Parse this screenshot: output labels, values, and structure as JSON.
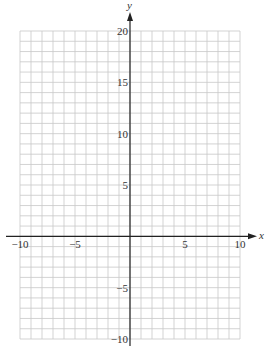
{
  "chart_data": {
    "type": "scatter",
    "title": "",
    "xlabel": "x",
    "ylabel": "y",
    "xlim": [
      -10,
      10
    ],
    "ylim": [
      -10,
      20
    ],
    "grid": true,
    "grid_step": 1,
    "x_ticks": [
      -10,
      -5,
      5,
      10
    ],
    "y_ticks": [
      20,
      15,
      10,
      5,
      -5,
      -10
    ],
    "x_tick_labels": [
      "−10",
      "−5",
      "5",
      "10"
    ],
    "y_tick_labels": [
      "20",
      "15",
      "10",
      "5",
      "−5",
      "−10"
    ],
    "series": []
  },
  "colors": {
    "grid": "#c8c8c8",
    "axis": "#222222",
    "text": "#333333"
  }
}
